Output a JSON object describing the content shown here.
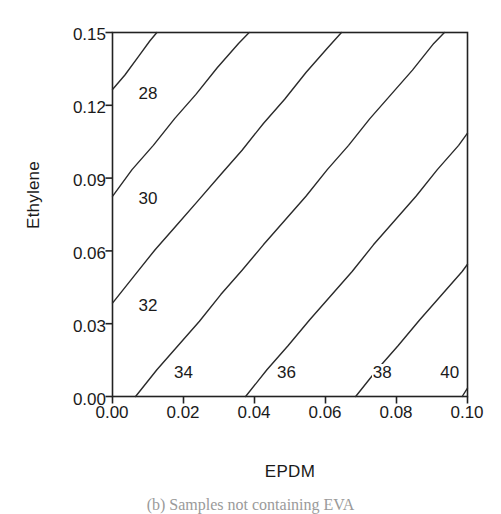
{
  "figure": {
    "caption": "(b) Samples not containing EVA"
  },
  "chart_data": {
    "type": "line",
    "subtype": "contour",
    "title": "",
    "xlabel": "EPDM",
    "ylabel": "Ethylene",
    "xlim": [
      0.0,
      0.1
    ],
    "ylim": [
      0.0,
      0.15
    ],
    "xticks": [
      "0.00",
      "0.02",
      "0.04",
      "0.06",
      "0.08",
      "0.10"
    ],
    "xtick_values": [
      0.0,
      0.02,
      0.04,
      0.06,
      0.08,
      0.1
    ],
    "yticks": [
      "0.00",
      "0.03",
      "0.06",
      "0.09",
      "0.12",
      "0.15"
    ],
    "ytick_values": [
      0.0,
      0.03,
      0.06,
      0.09,
      0.12,
      0.15
    ],
    "grid": false,
    "legend": null,
    "contour_levels": [
      28,
      30,
      32,
      34,
      36,
      38,
      40
    ],
    "contours": [
      {
        "level": "28",
        "label_x": 0.0045,
        "label_y": 0.1245,
        "points": [
          [
            0.0,
            0.1265
          ],
          [
            0.0035,
            0.1325
          ],
          [
            0.0075,
            0.1405
          ],
          [
            0.0105,
            0.1465
          ],
          [
            0.0125,
            0.15
          ]
        ]
      },
      {
        "level": "30",
        "label_x": 0.0045,
        "label_y": 0.0815,
        "points": [
          [
            0.0,
            0.0825
          ],
          [
            0.0055,
            0.0935
          ],
          [
            0.0115,
            0.1035
          ],
          [
            0.0175,
            0.1145
          ],
          [
            0.0235,
            0.1245
          ],
          [
            0.0295,
            0.1355
          ],
          [
            0.0355,
            0.1455
          ],
          [
            0.0385,
            0.15
          ]
        ]
      },
      {
        "level": "32",
        "label_x": 0.0045,
        "label_y": 0.0375,
        "points": [
          [
            0.0,
            0.0385
          ],
          [
            0.006,
            0.0495
          ],
          [
            0.012,
            0.0605
          ],
          [
            0.018,
            0.0705
          ],
          [
            0.024,
            0.0805
          ],
          [
            0.0305,
            0.0915
          ],
          [
            0.0365,
            0.1015
          ],
          [
            0.0425,
            0.1125
          ],
          [
            0.0485,
            0.1225
          ],
          [
            0.0545,
            0.1335
          ],
          [
            0.0605,
            0.1435
          ],
          [
            0.0645,
            0.15
          ]
        ]
      },
      {
        "level": "34",
        "label_x": 0.0145,
        "label_y": 0.0095,
        "points": [
          [
            0.0065,
            0.0
          ],
          [
            0.0125,
            0.011
          ],
          [
            0.0185,
            0.021
          ],
          [
            0.0245,
            0.031
          ],
          [
            0.0305,
            0.042
          ],
          [
            0.0365,
            0.052
          ],
          [
            0.0425,
            0.0625
          ],
          [
            0.0485,
            0.0725
          ],
          [
            0.0545,
            0.0825
          ],
          [
            0.0605,
            0.0935
          ],
          [
            0.0665,
            0.1035
          ],
          [
            0.0725,
            0.1145
          ],
          [
            0.0785,
            0.1245
          ],
          [
            0.0845,
            0.1345
          ],
          [
            0.0905,
            0.1455
          ],
          [
            0.0935,
            0.15
          ]
        ]
      },
      {
        "level": "36",
        "label_x": 0.0435,
        "label_y": 0.0095,
        "points": [
          [
            0.0375,
            0.0
          ],
          [
            0.0435,
            0.011
          ],
          [
            0.0495,
            0.021
          ],
          [
            0.0555,
            0.0315
          ],
          [
            0.0615,
            0.0415
          ],
          [
            0.0675,
            0.0515
          ],
          [
            0.0735,
            0.0625
          ],
          [
            0.0795,
            0.0725
          ],
          [
            0.0855,
            0.0825
          ],
          [
            0.0915,
            0.0935
          ],
          [
            0.0975,
            0.1035
          ],
          [
            0.1,
            0.1085
          ]
        ]
      },
      {
        "level": "38",
        "label_x": 0.0705,
        "label_y": 0.0095,
        "points": [
          [
            0.0685,
            0.0
          ],
          [
            0.0745,
            0.011
          ],
          [
            0.0805,
            0.021
          ],
          [
            0.0865,
            0.0315
          ],
          [
            0.0925,
            0.0415
          ],
          [
            0.0985,
            0.0515
          ],
          [
            0.1,
            0.0545
          ]
        ]
      },
      {
        "level": "40",
        "label_x": 0.0895,
        "label_y": 0.0095,
        "points": [
          [
            0.0985,
            0.0
          ],
          [
            0.1,
            0.0035
          ]
        ]
      }
    ]
  }
}
